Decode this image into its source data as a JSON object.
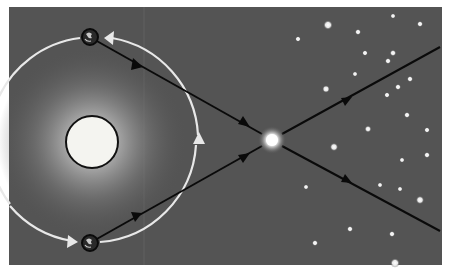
{
  "diagram": {
    "colors": {
      "background": "#545454",
      "frame": "#ffffff",
      "orbit": "#e8e8e8",
      "sun": "#f4f4f0",
      "sun_outline": "#111111",
      "sight_line": "#0a0a0a",
      "star": "#f2f2f2"
    },
    "sun": {
      "cx": 92,
      "cy": 142,
      "r": 26,
      "glow_r": 95
    },
    "orbit": {
      "cx": 92,
      "cy": 140,
      "r": 104
    },
    "earth_positions": [
      {
        "name": "earth-top",
        "cx": 90,
        "cy": 37
      },
      {
        "name": "earth-bottom",
        "cx": 90,
        "cy": 243
      }
    ],
    "nearby_star": {
      "cx": 272,
      "cy": 140,
      "r": 12
    },
    "sight_lines": [
      {
        "from": [
          90,
          37
        ],
        "to": [
          440,
          228
        ]
      },
      {
        "from": [
          90,
          243
        ],
        "to": [
          440,
          47
        ]
      }
    ],
    "background_stars": [
      [
        328,
        25,
        2.5
      ],
      [
        358,
        32,
        1.6
      ],
      [
        393,
        16,
        1.4
      ],
      [
        420,
        24,
        1.6
      ],
      [
        298,
        39,
        1.5
      ],
      [
        365,
        53,
        1.5
      ],
      [
        393,
        53,
        1.7
      ],
      [
        388,
        61,
        1.6
      ],
      [
        355,
        74,
        1.4
      ],
      [
        410,
        79,
        1.6
      ],
      [
        398,
        87,
        1.6
      ],
      [
        326,
        89,
        2.0
      ],
      [
        387,
        95,
        1.5
      ],
      [
        407,
        115,
        1.6
      ],
      [
        368,
        129,
        1.8
      ],
      [
        427,
        130,
        1.5
      ],
      [
        334,
        147,
        2.2
      ],
      [
        402,
        160,
        1.4
      ],
      [
        427,
        155,
        1.6
      ],
      [
        306,
        187,
        1.4
      ],
      [
        380,
        185,
        1.4
      ],
      [
        400,
        189,
        1.4
      ],
      [
        420,
        200,
        2.2
      ],
      [
        350,
        229,
        1.6
      ],
      [
        392,
        234,
        1.6
      ],
      [
        315,
        243,
        1.6
      ],
      [
        395,
        263,
        2.5
      ]
    ]
  }
}
